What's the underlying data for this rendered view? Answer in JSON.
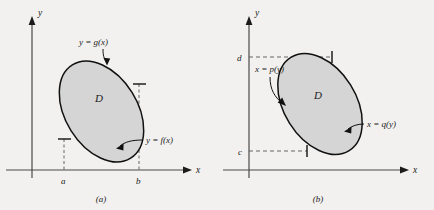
{
  "figure": {
    "background_color": "#f2f1ef",
    "ink_color": "#1b1b1b",
    "region_fill_color": "#d5d5d5",
    "panels": [
      {
        "id": "panel-a",
        "caption": "(a)",
        "axis_x_label": "x",
        "axis_y_label": "y",
        "region_label": "D",
        "upper_curve_label": "y = g(x)",
        "lower_curve_label": "y = f(x)",
        "tick_labels": [
          "a",
          "b"
        ],
        "tick_a": "a",
        "tick_b": "b",
        "description": "Type I region bounded above by y = g(x) and below by y = f(x), between x = a and x = b"
      },
      {
        "id": "panel-b",
        "caption": "(b)",
        "axis_x_label": "x",
        "axis_y_label": "y",
        "region_label": "D",
        "left_curve_label": "x = p(y)",
        "right_curve_label": "x = q(y)",
        "tick_labels": [
          "c",
          "d"
        ],
        "tick_c": "c",
        "tick_d": "d",
        "description": "Type II region bounded left by x = p(y) and right by x = q(y), between y = c and y = d"
      }
    ]
  }
}
